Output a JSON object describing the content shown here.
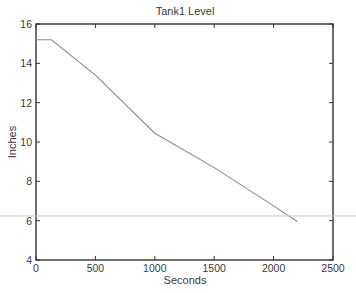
{
  "chart_data": {
    "type": "line",
    "title": "Tank1 Level",
    "xlabel": "Seconds",
    "ylabel": "Inches",
    "xlim": [
      0,
      2500
    ],
    "ylim": [
      4,
      16
    ],
    "xticks": [
      0,
      500,
      1000,
      1500,
      2000,
      2500
    ],
    "yticks": [
      4,
      6,
      8,
      10,
      12,
      14,
      16
    ],
    "xtick_labels": [
      "0",
      "500",
      "1000",
      "1500",
      "2000",
      "2500"
    ],
    "ytick_labels": [
      "4",
      "6",
      "8",
      "10",
      "12",
      "14",
      "16"
    ],
    "grid": false,
    "legend": null,
    "series": [
      {
        "name": "Tank1 Level",
        "color": "#8c8c8c",
        "x": [
          0,
          130,
          500,
          1000,
          1500,
          2000,
          2200
        ],
        "y": [
          15.2,
          15.2,
          13.4,
          10.45,
          8.7,
          6.75,
          5.95
        ]
      }
    ],
    "annotations": [
      {
        "type": "horizontal-line",
        "y": 6.24,
        "color": "#c8c8c8",
        "span": "full-image-width"
      }
    ]
  }
}
